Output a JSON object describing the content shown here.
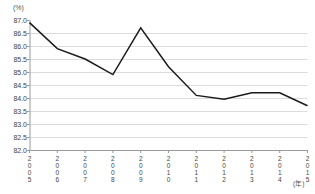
{
  "chart_data": {
    "type": "line",
    "title": "",
    "subtitle": "",
    "xlabel": "(年)",
    "ylabel": "(%)",
    "categories": [
      "2005",
      "2006",
      "2007",
      "2008",
      "2009",
      "2010",
      "2011",
      "2012",
      "2013",
      "2014",
      "2015"
    ],
    "x": [
      2005,
      2006,
      2007,
      2008,
      2009,
      2010,
      2011,
      2012,
      2013,
      2014,
      2015
    ],
    "values": [
      86.9,
      85.9,
      85.5,
      84.9,
      86.7,
      85.2,
      84.1,
      83.95,
      84.2,
      84.2,
      83.7
    ],
    "series": [
      {
        "name": "",
        "values": [
          86.9,
          85.9,
          85.5,
          84.9,
          86.7,
          85.2,
          84.1,
          83.95,
          84.2,
          84.2,
          83.7
        ]
      }
    ],
    "ylim": [
      82.0,
      87.0
    ],
    "yticks": [
      87.0,
      86.5,
      86.0,
      85.5,
      85.0,
      84.5,
      84.0,
      83.5,
      83.0,
      82.5,
      82.0
    ],
    "ytick_labels": [
      "87.0",
      "86.5",
      "86.0",
      "85.5",
      "85.0",
      "84.5",
      "84.0",
      "83.5",
      "83.0",
      "82.5",
      "82.0"
    ],
    "grid": "horizontal",
    "legend": "none",
    "line_color": "#1a1a1a",
    "grid_color": "#dcdcdc",
    "axis_color": "#9a9a9a",
    "annotations": []
  },
  "axis": {
    "y_unit": "(%)",
    "x_unit": "(年)"
  }
}
